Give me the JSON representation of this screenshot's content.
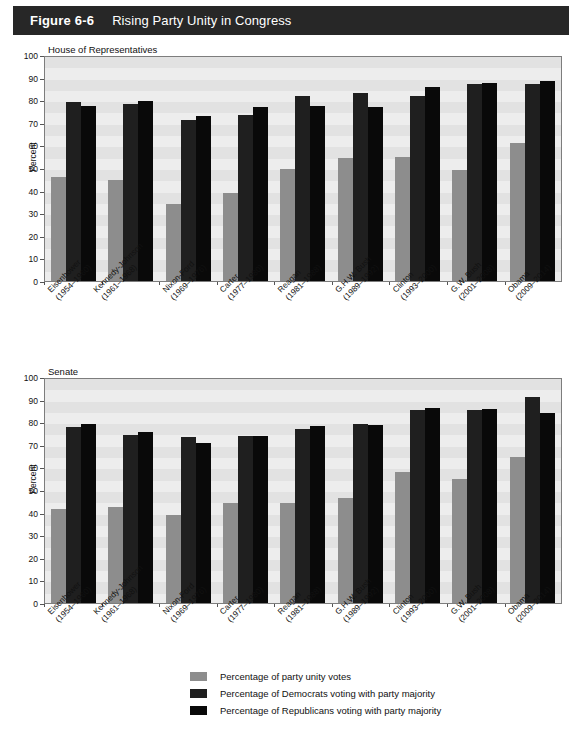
{
  "header": {
    "figure_number": "Figure 6-6",
    "title": "Rising Party Unity in Congress"
  },
  "legend": {
    "items": [
      {
        "key": "unity",
        "label": "Percentage of party unity votes",
        "color": "#8d8d8d"
      },
      {
        "key": "dem",
        "label": "Percentage of Democrats voting with party majority",
        "color": "#1f1f1f"
      },
      {
        "key": "rep",
        "label": "Percentage of Republicans voting with party majority",
        "color": "#090909"
      }
    ]
  },
  "axis": {
    "ylabel": "Percent",
    "yticks": [
      "100",
      "90",
      "80",
      "70",
      "60",
      "50",
      "40",
      "30",
      "20",
      "10",
      "0"
    ]
  },
  "categories": [
    {
      "name": "Eisenhower",
      "years": "(1954–1960)"
    },
    {
      "name": "Kennedy-Johnson",
      "years": "(1961–1968)"
    },
    {
      "name": "Nixon-Ford",
      "years": "(1969–1976)"
    },
    {
      "name": "Carter",
      "years": "(1977–1980)"
    },
    {
      "name": "Reagan",
      "years": "(1981–1988)"
    },
    {
      "name": "G.H.W. Bush",
      "years": "(1989–1992)"
    },
    {
      "name": "Clinton",
      "years": "(1993–2000)"
    },
    {
      "name": "G.W. Bush",
      "years": "(2001–2008)"
    },
    {
      "name": "Obama",
      "years": "(2009–2014)"
    }
  ],
  "chart_data": [
    {
      "type": "bar",
      "title": "House of Representatives",
      "xlabel": "",
      "ylabel": "Percent",
      "ylim": [
        0,
        100
      ],
      "grid": "horizontal-bands",
      "legend_position": "bottom",
      "categories": [
        "Eisenhower (1954–1960)",
        "Kennedy-Johnson (1961–1968)",
        "Nixon-Ford (1969–1976)",
        "Carter (1977–1980)",
        "Reagan (1981–1988)",
        "G.H.W. Bush (1989–1992)",
        "Clinton (1993–2000)",
        "G.W. Bush (2001–2008)",
        "Obama (2009–2014)"
      ],
      "series": [
        {
          "name": "Percentage of party unity votes",
          "values": [
            46.5,
            45,
            34.5,
            39.5,
            50,
            55,
            55.5,
            49.5,
            61.5
          ]
        },
        {
          "name": "Percentage of Democrats voting with party majority",
          "values": [
            80,
            79,
            72,
            74,
            82.5,
            84,
            82.5,
            88,
            88
          ]
        },
        {
          "name": "Percentage of Republicans voting with party majority",
          "values": [
            78,
            80.5,
            73.5,
            77.5,
            78,
            77.5,
            86.5,
            88.5,
            89.5
          ]
        }
      ]
    },
    {
      "type": "bar",
      "title": "Senate",
      "xlabel": "",
      "ylabel": "Percent",
      "ylim": [
        0,
        100
      ],
      "grid": "horizontal-bands",
      "legend_position": "bottom",
      "categories": [
        "Eisenhower (1954–1960)",
        "Kennedy-Johnson (1961–1968)",
        "Nixon-Ford (1969–1976)",
        "Carter (1977–1980)",
        "Reagan (1981–1988)",
        "G.H.W. Bush (1989–1992)",
        "Clinton (1993–2000)",
        "G.W. Bush (2001–2008)",
        "Obama (2009–2014)"
      ],
      "series": [
        {
          "name": "Percentage of party unity votes",
          "values": [
            42,
            43,
            39.5,
            44.5,
            44.5,
            47,
            58.5,
            55.5,
            65
          ]
        },
        {
          "name": "Percentage of Democrats voting with party majority",
          "values": [
            78.5,
            75,
            74,
            74.5,
            77.5,
            80,
            86,
            86,
            92
          ]
        },
        {
          "name": "Percentage of Republicans voting with party majority",
          "values": [
            80,
            76.5,
            71.5,
            74.5,
            79,
            79.5,
            87,
            86.5,
            85
          ]
        }
      ]
    }
  ]
}
